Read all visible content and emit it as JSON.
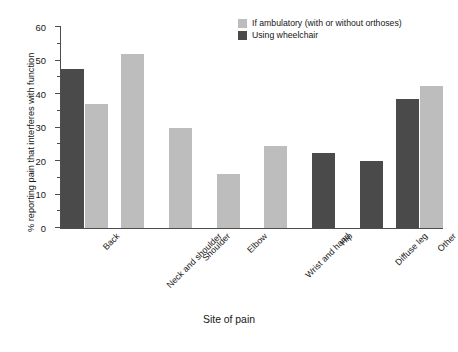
{
  "chart_data": {
    "type": "bar",
    "title": "",
    "xlabel": "Site of pain",
    "ylabel": "% reporting pain that interferes with function",
    "ylim": [
      0,
      60
    ],
    "yticks": [
      0,
      10,
      20,
      30,
      40,
      50,
      60
    ],
    "ytick_labels": [
      "0",
      "10",
      "20",
      "30",
      "40",
      "50",
      "60"
    ],
    "minor_tick_step": 5,
    "grid": false,
    "legend_position": "top-right",
    "categories": [
      "Back",
      "Neck and shoulder",
      "Shoulder",
      "Elbow",
      "Wrist and hand",
      "Hip",
      "Diffuse leg",
      "Other"
    ],
    "series": [
      {
        "name": "Using wheelchair",
        "color": "#4a4a4a",
        "values": [
          47.5,
          null,
          null,
          null,
          null,
          22.5,
          20.0,
          38.5
        ]
      },
      {
        "name": "If ambulatory (with or without orthoses)",
        "color": "#bdbdbd",
        "values": [
          37.0,
          52.0,
          30.0,
          16.0,
          24.5,
          null,
          null,
          42.5
        ]
      }
    ]
  },
  "legend": {
    "items": [
      {
        "label": "If ambulatory (with or without orthoses)",
        "color": "#bdbdbd"
      },
      {
        "label": "Using wheelchair",
        "color": "#4a4a4a"
      }
    ]
  },
  "axes": {
    "y_title": "% reporting pain that interferes with function",
    "x_title": "Site of pain"
  }
}
